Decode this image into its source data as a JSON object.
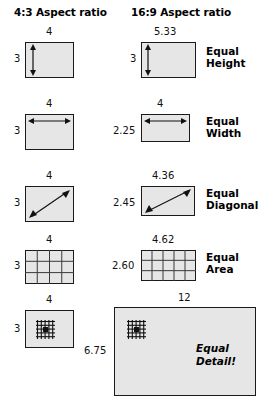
{
  "diagram": {
    "title_43": "4:3 Aspect ratio",
    "title_169": "16:9 Aspect ratio",
    "rows": [
      {
        "caption_line1": "Equal",
        "caption_line2": "Height",
        "left": {
          "top_label": "4",
          "side_label": "3",
          "w": 4,
          "h": 3,
          "marker": "v-arrow"
        },
        "right": {
          "top_label": "5.33",
          "side_label": "3",
          "w": 5.33,
          "h": 3,
          "marker": "v-arrow"
        }
      },
      {
        "caption_line1": "Equal",
        "caption_line2": "Width",
        "left": {
          "top_label": "4",
          "side_label": "3",
          "w": 4,
          "h": 3,
          "marker": "h-arrow"
        },
        "right": {
          "top_label": "4",
          "side_label": "2.25",
          "w": 4,
          "h": 2.25,
          "marker": "h-arrow"
        }
      },
      {
        "caption_line1": "Equal",
        "caption_line2": "Diagonal",
        "left": {
          "top_label": "4",
          "side_label": "3",
          "w": 4,
          "h": 3,
          "marker": "d-arrow"
        },
        "right": {
          "top_label": "4.36",
          "side_label": "2.45",
          "w": 4.36,
          "h": 2.45,
          "marker": "d-arrow"
        }
      },
      {
        "caption_line1": "Equal",
        "caption_line2": "Area",
        "left": {
          "top_label": "4",
          "side_label": "3",
          "w": 4,
          "h": 3,
          "marker": "grid",
          "cols": 4,
          "rows": 3
        },
        "right": {
          "top_label": "4.62",
          "side_label": "2.60",
          "w": 4.62,
          "h": 2.6,
          "marker": "grid",
          "cols": 5,
          "rows": 3
        }
      },
      {
        "caption_line1": "Equal",
        "caption_line2": "Detail!",
        "left": {
          "top_label": "4",
          "side_label": "3",
          "w": 4,
          "h": 3,
          "marker": "pixel-detail"
        },
        "right": {
          "top_label": "12",
          "side_label": "6.75",
          "w": 12,
          "h": 6.75,
          "marker": "pixel-detail"
        }
      }
    ],
    "colors": {
      "fill": "#e6e6e6",
      "stroke": "#1a1a1a",
      "text": "#000000"
    }
  }
}
